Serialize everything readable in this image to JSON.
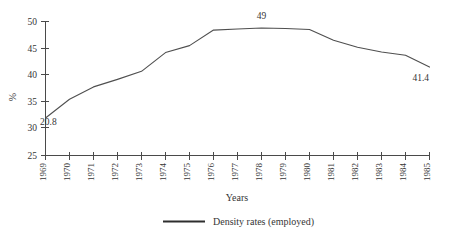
{
  "chart_data": {
    "type": "line",
    "title": "",
    "xlabel": "Years",
    "ylabel": "%",
    "categories": [
      "1969",
      "1970",
      "1971",
      "1972",
      "1973",
      "1974",
      "1975",
      "1976",
      "1977",
      "1978",
      "1979",
      "1980",
      "1981",
      "1982",
      "1983",
      "1984",
      "1985"
    ],
    "series": [
      {
        "name": "Density rates (employed)",
        "values": [
          32.0,
          35.5,
          37.8,
          39.2,
          40.7,
          44.2,
          45.5,
          48.4,
          48.6,
          48.8,
          48.7,
          48.5,
          46.5,
          45.2,
          44.3,
          43.7,
          41.5
        ]
      }
    ],
    "ylim": [
      25,
      50
    ],
    "yticks": [
      "25",
      "30",
      "35",
      "40",
      "45",
      "50"
    ],
    "grid": false,
    "legend_position": "bottom",
    "line_color": "#4f4f4f",
    "annotations": [
      {
        "text": "20.8",
        "category": "1969",
        "position": "start"
      },
      {
        "text": "49",
        "category": "1978",
        "position": "peak"
      },
      {
        "text": "41.4",
        "category": "1985",
        "position": "end"
      }
    ]
  },
  "axes": {
    "y_axis_label": "%",
    "x_axis_label": "Years",
    "y_ticks": [
      "50",
      "45",
      "40",
      "35",
      "30",
      "25"
    ],
    "x_ticks": [
      "1969",
      "1970",
      "1971",
      "1972",
      "1973",
      "1974",
      "1975",
      "1976",
      "1977",
      "1978",
      "1979",
      "1980",
      "1981",
      "1982",
      "1983",
      "1984",
      "1985"
    ]
  },
  "annotations": {
    "start_value": "20.8",
    "peak_value": "49",
    "end_value": "41.4"
  },
  "legend": {
    "entries": [
      {
        "label": "Density rates (employed)",
        "color": "#2e2e2e",
        "marker": "line-swatch"
      }
    ]
  }
}
